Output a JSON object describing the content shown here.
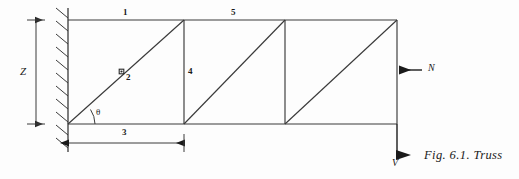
{
  "figure": {
    "caption": "Fig. 6.1. Truss",
    "background_color": "#fdfdfd",
    "line_color": "#3a3a3a",
    "text_color": "#1a1a1a"
  },
  "labels": {
    "member_1": "1",
    "member_2": "2",
    "member_3": "3",
    "member_4": "4",
    "member_5": "5",
    "height_dimension": "Z",
    "angle": "θ",
    "force_normal": "N",
    "force_shear": "V"
  },
  "geometry": {
    "top_chord_y": 20,
    "bottom_chord_y": 124,
    "wall_x": 68,
    "panel_points_x": [
      68,
      184,
      285,
      397
    ],
    "panels": 3,
    "diagonal_direction": "up-right",
    "support_type": "fixed-wall-hatched",
    "height_dim_line_x": 36,
    "span_dim_line_y": 143,
    "span_dim_from_x": 68,
    "span_dim_to_x": 184
  },
  "annotations": {
    "node_marker_on_diagonal": "small-square-node",
    "normal_force_direction": "left",
    "shear_force_direction": "down"
  }
}
